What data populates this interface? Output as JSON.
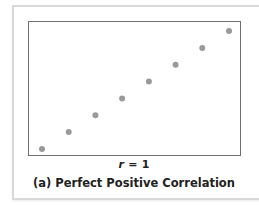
{
  "chart_data": {
    "type": "scatter",
    "title": "(a) Perfect Positive Correlation",
    "subtitle": "r = 1",
    "correlation_label": {
      "symbol": "r",
      "equals": "=",
      "value": "1"
    },
    "xlabel": "",
    "ylabel": "",
    "grid": false,
    "legend": null,
    "x": [
      1,
      2,
      3,
      4,
      5,
      6,
      7,
      8
    ],
    "y": [
      1,
      2,
      3,
      4,
      5,
      6,
      7,
      8
    ],
    "xlim": [
      0.5,
      8.5
    ],
    "ylim": [
      0.5,
      8.5
    ],
    "marker_color": "#9a9a9a",
    "frame_color": "#6f6f6f"
  }
}
